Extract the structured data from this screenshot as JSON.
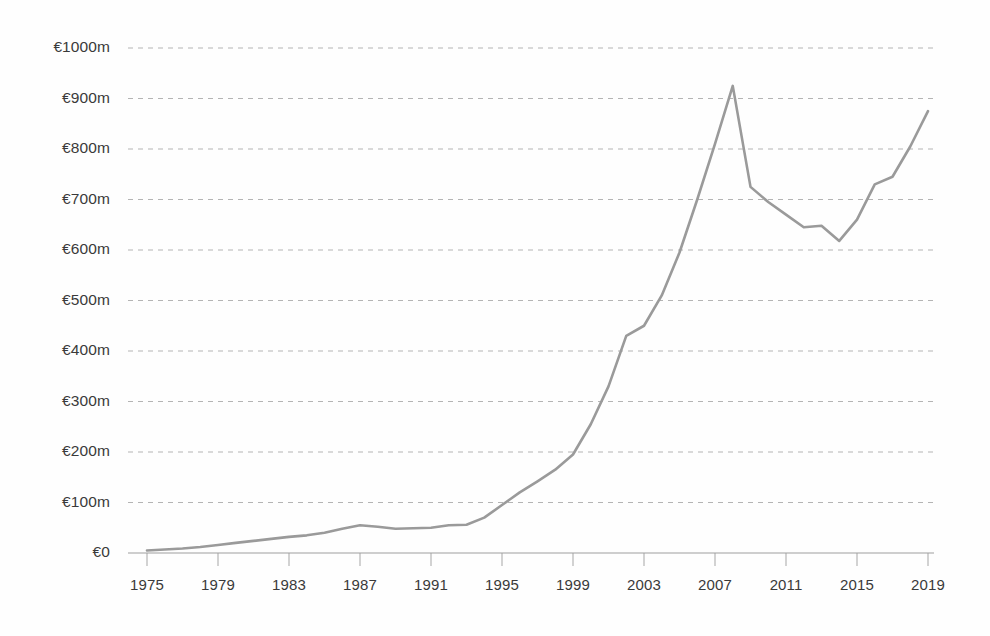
{
  "chart_data": {
    "type": "line",
    "title": "",
    "subtitle": "",
    "xlabel": "",
    "ylabel": "",
    "grid": true,
    "legend": false,
    "legend_position": "none",
    "line_color": "#9a9a9a",
    "grid_color": "#b4b4b4",
    "axis_color": "#9d9d9d",
    "background_color": "#fefefe",
    "text_color": "#3a3a3a",
    "currency_symbol": "€",
    "value_unit": "m",
    "xlim": [
      1974,
      2020
    ],
    "ylim": [
      0,
      1000
    ],
    "y_tick_step": 100,
    "x_tick_step": 4,
    "y_tick_labels": [
      "€0",
      "€100m",
      "€200m",
      "€300m",
      "€400m",
      "€500m",
      "€600m",
      "€700m",
      "€800m",
      "€900m",
      "€1000m"
    ],
    "y_tick_values": [
      0,
      100,
      200,
      300,
      400,
      500,
      600,
      700,
      800,
      900,
      1000
    ],
    "x_tick_labels": [
      "1975",
      "1979",
      "1983",
      "1987",
      "1991",
      "1995",
      "1999",
      "2003",
      "2007",
      "2011",
      "2015",
      "2019"
    ],
    "x_tick_values": [
      1975,
      1979,
      1983,
      1987,
      1991,
      1995,
      1999,
      2003,
      2007,
      2011,
      2015,
      2019
    ],
    "x": [
      1975,
      1976,
      1977,
      1978,
      1979,
      1980,
      1981,
      1982,
      1983,
      1984,
      1985,
      1986,
      1987,
      1988,
      1989,
      1990,
      1991,
      1992,
      1993,
      1994,
      1995,
      1996,
      1997,
      1998,
      1999,
      2000,
      2001,
      2002,
      2003,
      2004,
      2005,
      2006,
      2007,
      2008,
      2009,
      2010,
      2011,
      2012,
      2013,
      2014,
      2015,
      2016,
      2017,
      2018,
      2019
    ],
    "values": [
      5,
      7,
      9,
      12,
      16,
      20,
      24,
      28,
      32,
      35,
      40,
      48,
      55,
      52,
      48,
      49,
      50,
      55,
      56,
      70,
      95,
      120,
      142,
      165,
      195,
      255,
      330,
      430,
      450,
      510,
      595,
      700,
      810,
      925,
      725,
      695,
      670,
      645,
      648,
      618,
      660,
      730,
      745,
      805,
      875
    ],
    "series": [
      {
        "name": "Value",
        "color": "#9a9a9a",
        "values": [
          5,
          7,
          9,
          12,
          16,
          20,
          24,
          28,
          32,
          35,
          40,
          48,
          55,
          52,
          48,
          49,
          50,
          55,
          56,
          70,
          95,
          120,
          142,
          165,
          195,
          255,
          330,
          430,
          450,
          510,
          595,
          700,
          810,
          925,
          725,
          695,
          670,
          645,
          648,
          618,
          660,
          730,
          745,
          805,
          875
        ]
      }
    ],
    "annotations": {
      "peak_year": 2008,
      "peak_value": 925,
      "trough_year": 2014,
      "trough_value": 618,
      "start_value": 5,
      "end_value": 875
    }
  }
}
